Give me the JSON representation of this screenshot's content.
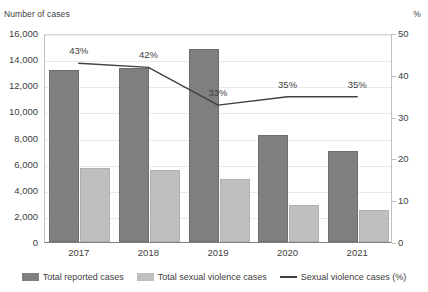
{
  "chart_data": {
    "type": "bar",
    "title": "",
    "categories": [
      "2017",
      "2018",
      "2019",
      "2020",
      "2021"
    ],
    "xlabel": "",
    "ylabel": "Number of cases",
    "y2label": "%",
    "ylim": [
      0,
      16000
    ],
    "y2lim": [
      0,
      50
    ],
    "yticks": [
      "0",
      "2,000",
      "4,000",
      "6,000",
      "8,000",
      "10,000",
      "12,000",
      "14,000",
      "16,000"
    ],
    "ytick_values": [
      0,
      2000,
      4000,
      6000,
      8000,
      10000,
      12000,
      14000,
      16000
    ],
    "y2ticks": [
      "0",
      "10",
      "20",
      "30",
      "40",
      "50"
    ],
    "y2tick_values": [
      0,
      10,
      20,
      30,
      40,
      50
    ],
    "grid": true,
    "legend_position": "bottom",
    "series": [
      {
        "name": "Total reported cases",
        "type": "bar",
        "axis": "left",
        "color": "#7f7f7f",
        "values": [
          13200,
          13350,
          14800,
          8200,
          7000
        ]
      },
      {
        "name": "Total sexual violence cases",
        "type": "bar",
        "axis": "left",
        "color": "#bfbfbf",
        "values": [
          5650,
          5500,
          4800,
          2850,
          2450
        ]
      },
      {
        "name": "Sexual violence cases (%)",
        "type": "line",
        "axis": "right",
        "color": "#404040",
        "values": [
          43,
          42,
          33,
          35,
          35
        ],
        "data_labels": [
          "43%",
          "42%",
          "33%",
          "35%",
          "35%"
        ]
      }
    ]
  },
  "axes": {
    "left_title": "Number of cases",
    "right_title": "%"
  },
  "legend": {
    "items": [
      {
        "label": "Total reported cases",
        "marker": "bar-swatch-dark"
      },
      {
        "label": "Total sexual violence cases",
        "marker": "bar-swatch-light"
      },
      {
        "label": "Sexual violence cases (%)",
        "marker": "line-swatch"
      }
    ]
  }
}
